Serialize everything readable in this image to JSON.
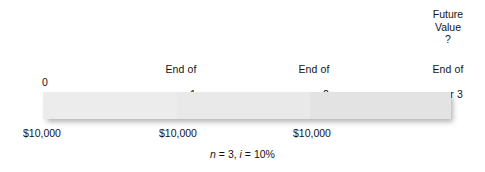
{
  "diagram": {
    "bar": {
      "segments": [
        {
          "name": "year-1",
          "shade": "#ececec"
        },
        {
          "name": "year-2",
          "shade": "#e9e9e9"
        },
        {
          "name": "year-3",
          "shade": "#e3e3e3"
        }
      ]
    },
    "period_labels": [
      {
        "line1": "0",
        "line2": ""
      },
      {
        "line1": "End of",
        "line2": "year 1"
      },
      {
        "line1": "End of",
        "line2": "year 2"
      },
      {
        "line1": "End of",
        "line2": "year 3"
      }
    ],
    "future_value": {
      "line1": "Future",
      "line2": "Value",
      "line3": "?"
    },
    "cash_flows": [
      {
        "amount": "$10,000"
      },
      {
        "amount": "$10,000"
      },
      {
        "amount": "$10,000"
      }
    ],
    "caption": {
      "n_symbol": "n",
      "n_equals": " = 3, ",
      "i_symbol": "i",
      "i_equals": " = 10%"
    }
  }
}
